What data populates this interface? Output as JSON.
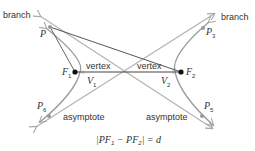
{
  "diagram": {
    "labels": {
      "branch_left": "branch",
      "branch_right": "branch",
      "vertex_left": "vertex",
      "vertex_right": "vertex",
      "asymptote_left": "asymptote",
      "asymptote_right": "asymptote"
    },
    "points": {
      "P": {
        "name": "P",
        "sub": ""
      },
      "P3": {
        "name": "P",
        "sub": "3"
      },
      "P5": {
        "name": "P",
        "sub": "5"
      },
      "P6": {
        "name": "P",
        "sub": "6"
      },
      "F1": {
        "name": "F",
        "sub": "1"
      },
      "F2": {
        "name": "F",
        "sub": "2"
      },
      "V1": {
        "name": "V",
        "sub": "1"
      },
      "V2": {
        "name": "V",
        "sub": "2"
      }
    },
    "equation": {
      "prefix": "|PF",
      "sub1": "1",
      "mid": " − PF",
      "sub2": "2",
      "suffix": "| = d"
    },
    "colors": {
      "curve": "#a0a0a0",
      "asymptote": "#b4b4b4",
      "focal_line": "#555555",
      "focus": "#111111",
      "text": "#333333"
    }
  }
}
